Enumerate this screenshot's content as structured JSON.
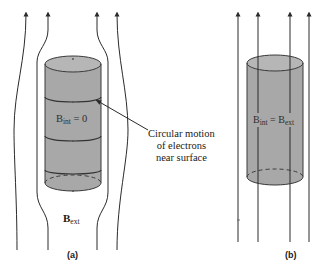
{
  "panels": [
    {
      "id": "a",
      "label": "(a)",
      "interior_label": {
        "symbol": "B",
        "subscript": "int",
        "rest": " = 0"
      },
      "exterior_label": {
        "symbol": "B",
        "subscript": "ext"
      },
      "callout": [
        "Circular motion",
        "of electrons",
        "near surface"
      ]
    },
    {
      "id": "b",
      "label": "(b)",
      "interior_label": {
        "symbol": "B",
        "subscript": "int",
        "rest": " = B",
        "subscript2": "ext"
      }
    }
  ],
  "colors": {
    "cylinder_fill": "#a8a8a8",
    "cylinder_top": "#b4b4b4",
    "line": "#2a2a2a",
    "background": "#ffffff"
  }
}
